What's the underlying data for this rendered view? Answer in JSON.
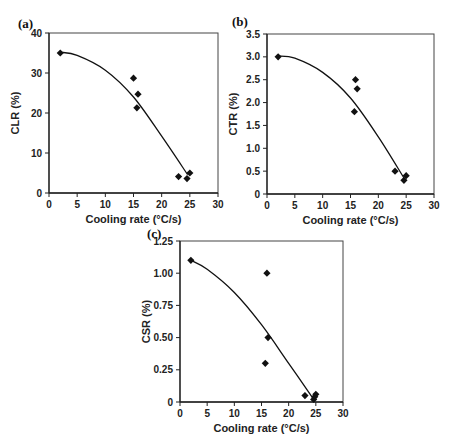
{
  "chart_data": [
    {
      "panel": "(a)",
      "type": "scatter",
      "xlabel": "Cooling rate (°C/s)",
      "ylabel": "CLR (%)",
      "xlim": [
        0,
        30
      ],
      "ylim": [
        0,
        40
      ],
      "xticks": [
        0,
        5,
        10,
        15,
        20,
        25,
        30
      ],
      "yticks": [
        0,
        10,
        20,
        30,
        40
      ],
      "yticklabels": [
        "0",
        "10",
        "20",
        "30",
        "40"
      ],
      "grid": false,
      "points": [
        [
          2,
          35
        ],
        [
          15,
          28.7
        ],
        [
          15.8,
          24.7
        ],
        [
          15.6,
          21.3
        ],
        [
          23,
          4.1
        ],
        [
          24.5,
          3.6
        ],
        [
          25,
          5
        ]
      ],
      "trendline": {
        "type": "polynomial",
        "points": [
          [
            2,
            35.2
          ],
          [
            5,
            34.4
          ],
          [
            10,
            30.7
          ],
          [
            15,
            24.0
          ],
          [
            20,
            14.2
          ],
          [
            24.6,
            4.6
          ]
        ]
      }
    },
    {
      "panel": "(b)",
      "type": "scatter",
      "xlabel": "Cooling rate (°C/s)",
      "ylabel": "CTR (%)",
      "xlim": [
        0,
        30
      ],
      "ylim": [
        0,
        3.5
      ],
      "xticks": [
        0,
        5,
        10,
        15,
        20,
        25,
        30
      ],
      "yticks": [
        0,
        0.5,
        1.0,
        1.5,
        2.0,
        2.5,
        3.0,
        3.5
      ],
      "yticklabels": [
        "0",
        "0.5",
        "1.0",
        "1.5",
        "2.0",
        "2.5",
        "3.0",
        "3.5"
      ],
      "grid": false,
      "points": [
        [
          2,
          3.0
        ],
        [
          15.9,
          2.5
        ],
        [
          16.2,
          2.3
        ],
        [
          15.7,
          1.8
        ],
        [
          23,
          0.5
        ],
        [
          24.6,
          0.3
        ],
        [
          25,
          0.4
        ]
      ],
      "trendline": {
        "type": "polynomial",
        "points": [
          [
            2,
            3.02
          ],
          [
            5,
            2.97
          ],
          [
            10,
            2.66
          ],
          [
            15,
            2.1
          ],
          [
            20,
            1.25
          ],
          [
            24.6,
            0.35
          ]
        ]
      }
    },
    {
      "panel": "(c)",
      "type": "scatter",
      "xlabel": "Cooling rate (°C/s)",
      "ylabel": "CSR (%)",
      "xlim": [
        0,
        30
      ],
      "ylim": [
        0,
        1.25
      ],
      "xticks": [
        0,
        5,
        10,
        15,
        20,
        25,
        30
      ],
      "yticks": [
        0,
        0.25,
        0.5,
        0.75,
        1.0,
        1.25
      ],
      "yticklabels": [
        "0",
        "0.25",
        "0.50",
        "0.75",
        "1.00",
        "1.25"
      ],
      "grid": false,
      "points": [
        [
          2,
          1.1
        ],
        [
          16,
          1.0
        ],
        [
          16.2,
          0.5
        ],
        [
          15.7,
          0.3
        ],
        [
          23,
          0.05
        ],
        [
          24.6,
          0.02
        ],
        [
          24.8,
          0.04
        ],
        [
          25,
          0.06
        ]
      ],
      "trendline": {
        "type": "polynomial",
        "points": [
          [
            2,
            1.1
          ],
          [
            5,
            1.03
          ],
          [
            10,
            0.85
          ],
          [
            15,
            0.6
          ],
          [
            20,
            0.3
          ],
          [
            24.6,
            0.02
          ]
        ]
      }
    }
  ]
}
